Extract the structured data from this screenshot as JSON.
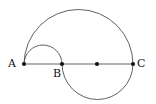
{
  "figure": {
    "width": 156,
    "height": 104,
    "background_color": "#ffffff",
    "baseline": {
      "name": "segment-AC",
      "color": "#b2b2b2",
      "y": 64,
      "x_start": 24,
      "x_end": 133
    },
    "arc_color": "#4f4f4f",
    "dot_color": "#151515",
    "points": [
      {
        "id": "A",
        "label": "A",
        "x": 24,
        "y": 64,
        "labeled": true
      },
      {
        "id": "B",
        "label": "B",
        "x": 62,
        "y": 64,
        "labeled": true
      },
      {
        "id": "M",
        "label": "",
        "x": 97,
        "y": 64,
        "labeled": false
      },
      {
        "id": "C",
        "label": "C",
        "x": 133,
        "y": 64,
        "labeled": true
      }
    ],
    "arcs": [
      {
        "name": "large-semicircle-AC-upper",
        "from": "A",
        "to": "C",
        "center_x": 78.5,
        "radius": 54.5,
        "side": "upper",
        "apex_y": 9.5
      },
      {
        "name": "small-semicircle-AB-upper",
        "from": "A",
        "to": "B",
        "center_x": 43,
        "radius": 19,
        "side": "upper",
        "apex_y": 45
      },
      {
        "name": "semicircle-BC-lower",
        "from": "B",
        "to": "C",
        "center_x": 97.5,
        "radius": 35.5,
        "side": "lower",
        "apex_y": 99.5
      }
    ],
    "labels": {
      "A": "A",
      "B": "B",
      "C": "C"
    }
  }
}
